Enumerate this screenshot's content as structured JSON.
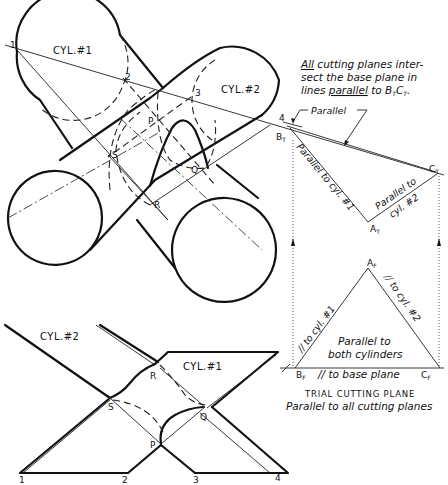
{
  "figure": {
    "top_view": {
      "cylinder_1_label": "CYL.#1",
      "cylinder_2_label": "CYL.#2",
      "points": [
        "1",
        "2",
        "3",
        "4",
        "P",
        "Q",
        "R",
        "S"
      ]
    },
    "front_view": {
      "cylinder_1_label": "CYL.#1",
      "cylinder_2_label": "CYL.#2",
      "points": [
        "1",
        "2",
        "3",
        "4",
        "P",
        "Q",
        "R",
        "S"
      ]
    },
    "note": {
      "line1_a": "All",
      "line1_b": " cutting planes inter-",
      "line2": "sect the base plane in",
      "line3_a": "lines ",
      "line3_b": "parallel",
      "line3_c": " to B",
      "line3_sub1": "T",
      "line3_d": "C",
      "line3_sub2": "T",
      "line3_e": "."
    },
    "parallel_callout": "Parallel",
    "top_triangle": {
      "vertex_b": "B",
      "vertex_b_sub": "T",
      "vertex_c": "C",
      "vertex_c_sub": "T",
      "vertex_a": "A",
      "vertex_a_sub": "T",
      "edge_ab_label": "Parallel to cyl. #1",
      "edge_ac_label_1": "Parallel to",
      "edge_ac_label_2": "cyl. #2"
    },
    "front_triangle": {
      "vertex_b": "B",
      "vertex_b_sub": "F",
      "vertex_c": "C",
      "vertex_c_sub": "F",
      "vertex_a": "A",
      "vertex_a_sub": "F",
      "edge_ab_label": "// to cyl. #1",
      "edge_ac_label": "// to cyl. #2",
      "center_label_1": "Parallel to",
      "center_label_2": "both cylinders",
      "base_label": "// to base plane"
    },
    "caption": {
      "title": "TRIAL CUTTING PLANE",
      "subtitle": "Parallel to all cutting planes"
    }
  }
}
